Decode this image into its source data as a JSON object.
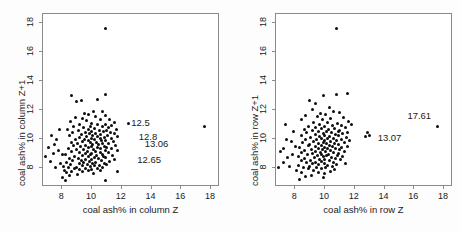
{
  "figure": {
    "background_color": "#fdfdfd",
    "panel_background_color": "#ffffff",
    "frame_color": "#8a8a8a",
    "point_color": "#0d0d0d"
  },
  "chart_data": [
    {
      "type": "scatter",
      "title": "",
      "xlabel": "coal ash% in column Z",
      "ylabel": "coal ash% in column Z+1",
      "xlim": [
        6.7,
        18.6
      ],
      "ylim": [
        6.7,
        18.6
      ],
      "xticks": [
        8,
        10,
        12,
        14,
        16,
        18
      ],
      "yticks": [
        8,
        10,
        12,
        14,
        16,
        18
      ],
      "xticklabels": [
        "8",
        "10",
        "12",
        "14",
        "16",
        "18"
      ],
      "yticklabels": [
        "8",
        "10",
        "12",
        "14",
        "16",
        "18"
      ],
      "grid": false,
      "legend": "none",
      "annotations": [
        {
          "text": "12.5",
          "x": 12.7,
          "y": 11.0
        },
        {
          "text": "12.8",
          "x": 13.2,
          "y": 10.1
        },
        {
          "text": "13.06",
          "x": 13.6,
          "y": 9.6
        },
        {
          "text": "12.65",
          "x": 13.1,
          "y": 8.5
        }
      ],
      "points": [
        [
          11.0,
          17.5
        ],
        [
          17.61,
          10.8
        ],
        [
          8.7,
          12.95
        ],
        [
          9.35,
          12.55
        ],
        [
          10.4,
          12.62
        ],
        [
          11.0,
          13.0
        ],
        [
          9.05,
          12.5
        ],
        [
          10.15,
          11.85
        ],
        [
          9.55,
          11.7
        ],
        [
          10.8,
          11.8
        ],
        [
          10.95,
          11.55
        ],
        [
          9.85,
          11.6
        ],
        [
          10.3,
          11.45
        ],
        [
          8.95,
          11.4
        ],
        [
          9.4,
          11.35
        ],
        [
          11.25,
          11.3
        ],
        [
          10.6,
          11.25
        ],
        [
          9.7,
          11.2
        ],
        [
          8.6,
          11.15
        ],
        [
          11.6,
          11.05
        ],
        [
          12.5,
          11.0
        ],
        [
          10.05,
          11.0
        ],
        [
          11.0,
          10.95
        ],
        [
          9.25,
          10.9
        ],
        [
          10.45,
          10.9
        ],
        [
          11.4,
          10.85
        ],
        [
          8.85,
          10.8
        ],
        [
          9.95,
          10.8
        ],
        [
          10.75,
          10.78
        ],
        [
          11.15,
          10.72
        ],
        [
          9.5,
          10.7
        ],
        [
          10.2,
          10.65
        ],
        [
          11.7,
          10.62
        ],
        [
          8.4,
          10.6
        ],
        [
          9.8,
          10.58
        ],
        [
          10.55,
          10.55
        ],
        [
          11.05,
          10.5
        ],
        [
          9.15,
          10.5
        ],
        [
          10.0,
          10.45
        ],
        [
          10.85,
          10.42
        ],
        [
          11.3,
          10.4
        ],
        [
          9.6,
          10.38
        ],
        [
          8.75,
          10.35
        ],
        [
          10.3,
          10.32
        ],
        [
          11.55,
          10.3
        ],
        [
          9.9,
          10.28
        ],
        [
          10.65,
          10.25
        ],
        [
          9.35,
          10.22
        ],
        [
          11.1,
          10.2
        ],
        [
          10.1,
          10.18
        ],
        [
          8.55,
          10.15
        ],
        [
          9.7,
          10.12
        ],
        [
          10.45,
          10.1
        ],
        [
          11.8,
          10.1
        ],
        [
          10.9,
          10.05
        ],
        [
          9.2,
          10.02
        ],
        [
          10.0,
          10.0
        ],
        [
          10.6,
          9.98
        ],
        [
          11.35,
          9.95
        ],
        [
          9.55,
          9.92
        ],
        [
          8.95,
          9.9
        ],
        [
          10.25,
          9.88
        ],
        [
          11.0,
          9.85
        ],
        [
          9.8,
          9.82
        ],
        [
          10.7,
          9.8
        ],
        [
          9.4,
          9.78
        ],
        [
          11.5,
          9.75
        ],
        [
          10.35,
          9.72
        ],
        [
          8.65,
          9.7
        ],
        [
          9.95,
          9.68
        ],
        [
          10.8,
          9.65
        ],
        [
          11.2,
          9.62
        ],
        [
          9.1,
          9.6
        ],
        [
          10.1,
          9.58
        ],
        [
          10.5,
          9.55
        ],
        [
          9.65,
          9.52
        ],
        [
          11.65,
          9.5
        ],
        [
          8.85,
          9.48
        ],
        [
          10.0,
          9.45
        ],
        [
          10.9,
          9.42
        ],
        [
          9.3,
          9.4
        ],
        [
          11.05,
          9.38
        ],
        [
          10.4,
          9.35
        ],
        [
          9.85,
          9.32
        ],
        [
          8.45,
          9.3
        ],
        [
          10.65,
          9.28
        ],
        [
          11.4,
          9.25
        ],
        [
          9.5,
          9.22
        ],
        [
          10.15,
          9.2
        ],
        [
          9.05,
          9.18
        ],
        [
          10.95,
          9.15
        ],
        [
          11.75,
          9.12
        ],
        [
          9.75,
          9.1
        ],
        [
          10.3,
          9.08
        ],
        [
          8.7,
          9.05
        ],
        [
          10.6,
          9.02
        ],
        [
          9.25,
          9.0
        ],
        [
          11.15,
          8.98
        ],
        [
          10.05,
          8.95
        ],
        [
          9.6,
          8.92
        ],
        [
          8.25,
          8.9
        ],
        [
          10.75,
          8.88
        ],
        [
          9.95,
          8.85
        ],
        [
          11.45,
          8.82
        ],
        [
          10.35,
          8.8
        ],
        [
          9.4,
          8.78
        ],
        [
          8.9,
          8.75
        ],
        [
          10.85,
          8.72
        ],
        [
          9.8,
          8.7
        ],
        [
          10.2,
          8.68
        ],
        [
          11.0,
          8.65
        ],
        [
          9.15,
          8.62
        ],
        [
          8.55,
          8.6
        ],
        [
          10.5,
          8.58
        ],
        [
          9.65,
          8.55
        ],
        [
          11.6,
          8.52
        ],
        [
          10.0,
          8.5
        ],
        [
          9.35,
          8.48
        ],
        [
          10.7,
          8.45
        ],
        [
          8.75,
          8.42
        ],
        [
          9.9,
          8.4
        ],
        [
          11.25,
          8.38
        ],
        [
          10.3,
          8.35
        ],
        [
          9.5,
          8.32
        ],
        [
          8.35,
          8.3
        ],
        [
          10.9,
          8.28
        ],
        [
          9.2,
          8.25
        ],
        [
          10.1,
          8.22
        ],
        [
          11.05,
          8.2
        ],
        [
          9.75,
          8.18
        ],
        [
          8.6,
          8.15
        ],
        [
          10.55,
          8.12
        ],
        [
          9.4,
          8.1
        ],
        [
          10.25,
          8.08
        ],
        [
          8.15,
          8.05
        ],
        [
          9.95,
          8.02
        ],
        [
          10.8,
          8.0
        ],
        [
          9.05,
          7.98
        ],
        [
          8.45,
          7.95
        ],
        [
          10.4,
          7.92
        ],
        [
          9.6,
          7.9
        ],
        [
          8.9,
          7.88
        ],
        [
          10.0,
          7.85
        ],
        [
          9.25,
          7.82
        ],
        [
          8.2,
          7.8
        ],
        [
          10.65,
          7.78
        ],
        [
          9.8,
          7.75
        ],
        [
          8.7,
          7.72
        ],
        [
          11.8,
          7.7
        ],
        [
          9.45,
          7.68
        ],
        [
          8.35,
          7.6
        ],
        [
          10.15,
          7.55
        ],
        [
          9.1,
          7.5
        ],
        [
          8.55,
          7.45
        ],
        [
          8.1,
          7.3
        ],
        [
          10.95,
          7.1
        ],
        [
          8.25,
          7.05
        ],
        [
          7.35,
          10.2
        ],
        [
          7.55,
          9.55
        ],
        [
          7.15,
          9.35
        ],
        [
          6.95,
          8.7
        ],
        [
          7.7,
          9.9
        ],
        [
          7.45,
          8.95
        ],
        [
          7.85,
          10.6
        ],
        [
          7.25,
          8.4
        ],
        [
          7.95,
          8.25
        ],
        [
          7.6,
          7.95
        ],
        [
          8.05,
          8.85
        ],
        [
          7.8,
          9.15
        ]
      ]
    },
    {
      "type": "scatter",
      "title": "",
      "xlabel": "coal ash% in row Z",
      "ylabel": "coal ash% in row Z+1",
      "xlim": [
        6.7,
        18.6
      ],
      "ylim": [
        6.7,
        18.6
      ],
      "xticks": [
        8,
        10,
        12,
        14,
        16,
        18
      ],
      "yticks": [
        8,
        10,
        12,
        14,
        16,
        18
      ],
      "xticklabels": [
        "8",
        "10",
        "12",
        "14",
        "16",
        "18"
      ],
      "yticklabels": [
        "8",
        "10",
        "12",
        "14",
        "16",
        "18"
      ],
      "grid": false,
      "legend": "none",
      "annotations": [
        {
          "text": "17.61",
          "x": 15.6,
          "y": 11.5
        },
        {
          "text": "13.07",
          "x": 13.6,
          "y": 10.0
        }
      ],
      "points": [
        [
          10.85,
          17.5
        ],
        [
          17.61,
          10.8
        ],
        [
          12.95,
          10.35
        ],
        [
          12.8,
          10.1
        ],
        [
          13.07,
          10.15
        ],
        [
          9.05,
          12.55
        ],
        [
          9.95,
          12.95
        ],
        [
          10.85,
          13.0
        ],
        [
          11.55,
          13.05
        ],
        [
          9.45,
          12.35
        ],
        [
          10.35,
          12.1
        ],
        [
          9.2,
          11.95
        ],
        [
          10.65,
          11.85
        ],
        [
          11.05,
          11.75
        ],
        [
          9.75,
          11.7
        ],
        [
          10.1,
          11.6
        ],
        [
          8.75,
          11.55
        ],
        [
          9.55,
          11.45
        ],
        [
          11.3,
          11.4
        ],
        [
          10.45,
          11.35
        ],
        [
          9.9,
          11.3
        ],
        [
          8.5,
          11.25
        ],
        [
          11.65,
          11.15
        ],
        [
          10.2,
          11.1
        ],
        [
          9.3,
          11.05
        ],
        [
          10.9,
          11.0
        ],
        [
          11.85,
          10.95
        ],
        [
          9.7,
          10.92
        ],
        [
          10.55,
          10.88
        ],
        [
          11.2,
          10.85
        ],
        [
          8.95,
          10.82
        ],
        [
          10.05,
          10.78
        ],
        [
          9.45,
          10.75
        ],
        [
          11.45,
          10.7
        ],
        [
          10.7,
          10.68
        ],
        [
          9.85,
          10.65
        ],
        [
          8.65,
          10.62
        ],
        [
          10.3,
          10.58
        ],
        [
          11.05,
          10.55
        ],
        [
          9.25,
          10.52
        ],
        [
          10.95,
          10.48
        ],
        [
          9.6,
          10.45
        ],
        [
          10.15,
          10.42
        ],
        [
          11.6,
          10.4
        ],
        [
          8.85,
          10.38
        ],
        [
          10.5,
          10.35
        ],
        [
          9.95,
          10.32
        ],
        [
          11.25,
          10.28
        ],
        [
          9.4,
          10.25
        ],
        [
          10.75,
          10.22
        ],
        [
          10.0,
          10.2
        ],
        [
          8.45,
          10.18
        ],
        [
          11.0,
          10.15
        ],
        [
          9.7,
          10.12
        ],
        [
          10.35,
          10.1
        ],
        [
          11.5,
          10.05
        ],
        [
          9.1,
          10.02
        ],
        [
          10.6,
          10.0
        ],
        [
          9.85,
          9.98
        ],
        [
          10.2,
          9.95
        ],
        [
          11.15,
          9.92
        ],
        [
          8.75,
          9.9
        ],
        [
          9.5,
          9.88
        ],
        [
          10.85,
          9.85
        ],
        [
          10.05,
          9.82
        ],
        [
          11.7,
          9.8
        ],
        [
          9.3,
          9.78
        ],
        [
          10.45,
          9.75
        ],
        [
          9.95,
          9.72
        ],
        [
          8.55,
          9.7
        ],
        [
          11.35,
          9.68
        ],
        [
          10.7,
          9.65
        ],
        [
          9.65,
          9.62
        ],
        [
          10.15,
          9.6
        ],
        [
          11.0,
          9.58
        ],
        [
          9.05,
          9.55
        ],
        [
          10.35,
          9.52
        ],
        [
          8.95,
          9.5
        ],
        [
          9.8,
          9.48
        ],
        [
          11.55,
          9.45
        ],
        [
          10.55,
          9.42
        ],
        [
          9.4,
          9.4
        ],
        [
          10.0,
          9.38
        ],
        [
          11.2,
          9.35
        ],
        [
          8.35,
          9.32
        ],
        [
          9.6,
          9.3
        ],
        [
          10.8,
          9.28
        ],
        [
          10.25,
          9.25
        ],
        [
          9.15,
          9.22
        ],
        [
          11.05,
          9.2
        ],
        [
          9.9,
          9.18
        ],
        [
          8.7,
          9.15
        ],
        [
          10.45,
          9.12
        ],
        [
          9.45,
          9.1
        ],
        [
          11.4,
          9.08
        ],
        [
          10.1,
          9.05
        ],
        [
          9.75,
          9.02
        ],
        [
          8.5,
          9.0
        ],
        [
          10.65,
          8.98
        ],
        [
          9.25,
          8.95
        ],
        [
          11.0,
          8.92
        ],
        [
          10.3,
          8.9
        ],
        [
          9.85,
          8.88
        ],
        [
          8.9,
          8.85
        ],
        [
          10.9,
          8.82
        ],
        [
          9.55,
          8.8
        ],
        [
          10.15,
          8.78
        ],
        [
          8.25,
          8.75
        ],
        [
          11.25,
          8.72
        ],
        [
          9.95,
          8.7
        ],
        [
          10.5,
          8.68
        ],
        [
          9.35,
          8.65
        ],
        [
          8.65,
          8.62
        ],
        [
          10.75,
          8.58
        ],
        [
          9.7,
          8.55
        ],
        [
          10.05,
          8.52
        ],
        [
          11.1,
          8.5
        ],
        [
          9.1,
          8.48
        ],
        [
          8.45,
          8.45
        ],
        [
          10.35,
          8.42
        ],
        [
          9.8,
          8.4
        ],
        [
          10.6,
          8.35
        ],
        [
          9.4,
          8.32
        ],
        [
          8.8,
          8.3
        ],
        [
          11.45,
          8.28
        ],
        [
          10.0,
          8.25
        ],
        [
          9.2,
          8.22
        ],
        [
          10.85,
          8.2
        ],
        [
          9.65,
          8.15
        ],
        [
          8.3,
          8.12
        ],
        [
          10.25,
          8.1
        ],
        [
          9.0,
          8.05
        ],
        [
          10.55,
          8.02
        ],
        [
          8.6,
          8.0
        ],
        [
          9.5,
          7.98
        ],
        [
          10.1,
          7.95
        ],
        [
          9.85,
          7.9
        ],
        [
          8.95,
          7.88
        ],
        [
          10.7,
          7.85
        ],
        [
          9.3,
          7.8
        ],
        [
          8.15,
          7.78
        ],
        [
          10.4,
          7.72
        ],
        [
          9.6,
          7.65
        ],
        [
          8.5,
          7.6
        ],
        [
          10.0,
          7.55
        ],
        [
          9.15,
          7.45
        ],
        [
          8.75,
          7.35
        ],
        [
          9.95,
          7.3
        ],
        [
          8.35,
          7.15
        ],
        [
          7.3,
          9.3
        ],
        [
          7.55,
          8.65
        ],
        [
          7.1,
          9.05
        ],
        [
          7.8,
          9.75
        ],
        [
          7.45,
          9.9
        ],
        [
          7.95,
          10.45
        ],
        [
          7.25,
          8.3
        ],
        [
          7.7,
          8.05
        ],
        [
          6.95,
          8.0
        ],
        [
          8.05,
          9.45
        ],
        [
          7.85,
          8.9
        ],
        [
          7.4,
          10.95
        ]
      ]
    }
  ]
}
